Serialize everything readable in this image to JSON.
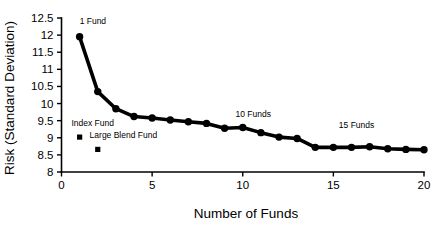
{
  "chart_data": {
    "type": "line",
    "title": "",
    "xlabel": "Number of Funds",
    "ylabel": "Risk (Standard Deviation)",
    "xlim": [
      0,
      20
    ],
    "ylim": [
      8,
      12.5
    ],
    "grid": false,
    "legend": "none",
    "x_ticks": [
      "0",
      "5",
      "10",
      "15",
      "20"
    ],
    "x_tick_values": [
      0,
      5,
      10,
      15,
      20
    ],
    "y_ticks": [
      "8",
      "8.5",
      "9",
      "9.5",
      "10",
      "10.5",
      "11",
      "11.5",
      "12",
      "12.5"
    ],
    "y_tick_values": [
      8,
      8.5,
      9,
      9.5,
      10,
      10.5,
      11,
      11.5,
      12,
      12.5
    ],
    "series": [
      {
        "name": "Portfolio risk",
        "x": [
          1,
          2,
          3,
          4,
          5,
          6,
          7,
          8,
          9,
          10,
          11,
          12,
          13,
          14,
          15,
          16,
          17,
          18,
          19,
          20
        ],
        "values": [
          11.95,
          10.35,
          9.85,
          9.62,
          9.58,
          9.52,
          9.47,
          9.42,
          9.28,
          9.3,
          9.15,
          9.02,
          8.98,
          8.72,
          8.72,
          8.72,
          8.74,
          8.68,
          8.66,
          8.65
        ]
      }
    ],
    "annotations": [
      {
        "name": "1-fund-annotation",
        "text": "1 Fund",
        "x": 1,
        "y": 12.33,
        "marker": "none"
      },
      {
        "name": "index-fund-annotation",
        "text": "Index Fund",
        "x": 0.55,
        "y": 9.35,
        "marker": "square",
        "marker_x": 1.0,
        "marker_y": 9.02
      },
      {
        "name": "large-blend-fund-annotation",
        "text": "Large Blend Fund",
        "x": 1.55,
        "y": 8.98,
        "marker": "square",
        "marker_x": 2.0,
        "marker_y": 8.66
      },
      {
        "name": "10-funds-annotation",
        "text": "10 Funds",
        "x": 9.6,
        "y": 9.62,
        "marker": "none"
      },
      {
        "name": "15-funds-annotation",
        "text": "15 Funds",
        "x": 15.3,
        "y": 9.28,
        "marker": "none"
      }
    ]
  }
}
